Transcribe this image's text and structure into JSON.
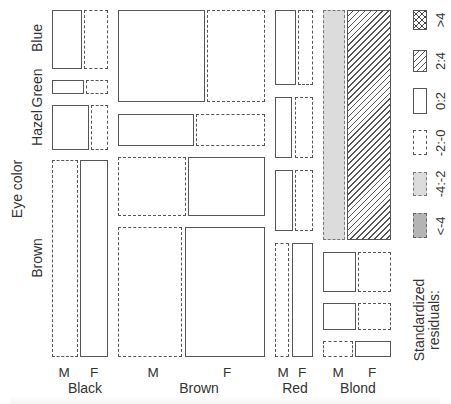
{
  "chart_data": {
    "type": "mosaic",
    "title": "",
    "xlabel": "Hair color (split by Sex)",
    "ylabel": "Eye color",
    "hair": [
      "Black",
      "Brown",
      "Red",
      "Blond"
    ],
    "eye": [
      "Blue",
      "Green",
      "Hazel",
      "Brown"
    ],
    "sex": [
      "M",
      "F"
    ],
    "legend": {
      "title": "Standardized residuals:",
      "entries": [
        ">4",
        "2:4",
        "0:2",
        "-2:-0",
        "-4:-2",
        "<-4"
      ]
    },
    "tiles": [
      {
        "hair": "Black",
        "eye": "Blue",
        "sex": "M",
        "residual": "0:2",
        "x": 52,
        "y": 10,
        "w": 30,
        "h": 59
      },
      {
        "hair": "Black",
        "eye": "Blue",
        "sex": "F",
        "residual": "-2:-0",
        "x": 84,
        "y": 10,
        "w": 24,
        "h": 59
      },
      {
        "hair": "Black",
        "eye": "Green",
        "sex": "M",
        "residual": "0:2",
        "x": 52,
        "y": 80,
        "w": 32,
        "h": 14
      },
      {
        "hair": "Black",
        "eye": "Green",
        "sex": "F",
        "residual": "-2:-0",
        "x": 86,
        "y": 80,
        "w": 22,
        "h": 14
      },
      {
        "hair": "Black",
        "eye": "Hazel",
        "sex": "M",
        "residual": "0:2",
        "x": 52,
        "y": 105,
        "w": 37,
        "h": 45
      },
      {
        "hair": "Black",
        "eye": "Hazel",
        "sex": "F",
        "residual": "-2:-0",
        "x": 91,
        "y": 105,
        "w": 17,
        "h": 45
      },
      {
        "hair": "Black",
        "eye": "Brown",
        "sex": "M",
        "residual": "-2:-0",
        "x": 52,
        "y": 160,
        "w": 26,
        "h": 197
      },
      {
        "hair": "Black",
        "eye": "Brown",
        "sex": "F",
        "residual": "0:2",
        "x": 80,
        "y": 160,
        "w": 28,
        "h": 197
      },
      {
        "hair": "Brown",
        "eye": "Blue",
        "sex": "M",
        "residual": "0:2",
        "x": 118,
        "y": 10,
        "w": 87,
        "h": 92
      },
      {
        "hair": "Brown",
        "eye": "Blue",
        "sex": "F",
        "residual": "-2:-0",
        "x": 207,
        "y": 10,
        "w": 58,
        "h": 92
      },
      {
        "hair": "Brown",
        "eye": "Green",
        "sex": "M",
        "residual": "0:2",
        "x": 118,
        "y": 114,
        "w": 76,
        "h": 32
      },
      {
        "hair": "Brown",
        "eye": "Green",
        "sex": "F",
        "residual": "-2:-0",
        "x": 196,
        "y": 114,
        "w": 69,
        "h": 32
      },
      {
        "hair": "Brown",
        "eye": "Hazel",
        "sex": "M",
        "residual": "-2:-0",
        "x": 118,
        "y": 157,
        "w": 68,
        "h": 59
      },
      {
        "hair": "Brown",
        "eye": "Hazel",
        "sex": "F",
        "residual": "0:2",
        "x": 188,
        "y": 157,
        "w": 77,
        "h": 59
      },
      {
        "hair": "Brown",
        "eye": "Brown",
        "sex": "M",
        "residual": "-2:-0",
        "x": 118,
        "y": 227,
        "w": 64,
        "h": 130
      },
      {
        "hair": "Brown",
        "eye": "Brown",
        "sex": "F",
        "residual": "0:2",
        "x": 185,
        "y": 227,
        "w": 80,
        "h": 130
      },
      {
        "hair": "Red",
        "eye": "Blue",
        "sex": "M",
        "residual": "0:2",
        "x": 275,
        "y": 10,
        "w": 21,
        "h": 75
      },
      {
        "hair": "Red",
        "eye": "Blue",
        "sex": "F",
        "residual": "-2:-0",
        "x": 298,
        "y": 10,
        "w": 15,
        "h": 75
      },
      {
        "hair": "Red",
        "eye": "Green",
        "sex": "M",
        "residual": "0:2",
        "x": 275,
        "y": 97,
        "w": 17,
        "h": 61
      },
      {
        "hair": "Red",
        "eye": "Green",
        "sex": "F",
        "residual": "-2:-0",
        "x": 295,
        "y": 97,
        "w": 18,
        "h": 61
      },
      {
        "hair": "Red",
        "eye": "Hazel",
        "sex": "M",
        "residual": "0:2",
        "x": 275,
        "y": 170,
        "w": 18,
        "h": 61
      },
      {
        "hair": "Red",
        "eye": "Hazel",
        "sex": "F",
        "residual": "-2:-0",
        "x": 295,
        "y": 170,
        "w": 18,
        "h": 61
      },
      {
        "hair": "Red",
        "eye": "Brown",
        "sex": "M",
        "residual": "-2:-0",
        "x": 275,
        "y": 243,
        "w": 14,
        "h": 114
      },
      {
        "hair": "Red",
        "eye": "Brown",
        "sex": "F",
        "residual": "0:2",
        "x": 292,
        "y": 243,
        "w": 21,
        "h": 114
      },
      {
        "hair": "Blond",
        "eye": "Blue",
        "sex": "M",
        "residual": "-4:-2",
        "x": 323,
        "y": 10,
        "w": 22,
        "h": 230
      },
      {
        "hair": "Blond",
        "eye": "Blue",
        "sex": "F",
        "residual": "2:4",
        "x": 347,
        "y": 10,
        "w": 44,
        "h": 230
      },
      {
        "hair": "Blond",
        "eye": "Green",
        "sex": "M",
        "residual": "0:2",
        "x": 323,
        "y": 252,
        "w": 33,
        "h": 40
      },
      {
        "hair": "Blond",
        "eye": "Green",
        "sex": "F",
        "residual": "-2:-0",
        "x": 358,
        "y": 252,
        "w": 33,
        "h": 40
      },
      {
        "hair": "Blond",
        "eye": "Hazel",
        "sex": "M",
        "residual": "0:2",
        "x": 323,
        "y": 303,
        "w": 33,
        "h": 27
      },
      {
        "hair": "Blond",
        "eye": "Hazel",
        "sex": "F",
        "residual": "-2:-0",
        "x": 358,
        "y": 303,
        "w": 33,
        "h": 27
      },
      {
        "hair": "Blond",
        "eye": "Brown",
        "sex": "M",
        "residual": "-2:-0",
        "x": 323,
        "y": 341,
        "w": 30,
        "h": 16
      },
      {
        "hair": "Blond",
        "eye": "Brown",
        "sex": "F",
        "residual": "0:2",
        "x": 355,
        "y": 341,
        "w": 36,
        "h": 16
      }
    ],
    "grid": false,
    "legend_position": "right"
  },
  "axis": {
    "y_title": "Eye color",
    "y_levels": [
      {
        "label": "Blue",
        "y": 38
      },
      {
        "label": "Green",
        "y": 88
      },
      {
        "label": "Hazel",
        "y": 128
      },
      {
        "label": "Brown",
        "y": 258
      }
    ],
    "x_sex_labels": [
      {
        "label": "M",
        "x": 64
      },
      {
        "label": "F",
        "x": 94
      },
      {
        "label": "M",
        "x": 153
      },
      {
        "label": "F",
        "x": 227
      },
      {
        "label": "M",
        "x": 283
      },
      {
        "label": "F",
        "x": 302
      },
      {
        "label": "M",
        "x": 338
      },
      {
        "label": "F",
        "x": 372
      }
    ],
    "x_hair_labels": [
      {
        "label": "Black",
        "x": 85
      },
      {
        "label": "Brown",
        "x": 199
      },
      {
        "label": "Red",
        "x": 295
      },
      {
        "label": "Blond",
        "x": 358
      }
    ]
  },
  "legend": {
    "title": "Standardized residuals:",
    "items": [
      {
        "label": ">4",
        "style": "cross",
        "y": 10,
        "h": 20
      },
      {
        "label": "2:4",
        "style": "hatch",
        "y": 50,
        "h": 22
      },
      {
        "label": "0:2",
        "style": "solid",
        "y": 88,
        "h": 26
      },
      {
        "label": "-2:-0",
        "style": "dashed",
        "y": 130,
        "h": 25
      },
      {
        "label": "-4:-2",
        "style": "neg2",
        "y": 172,
        "h": 24
      },
      {
        "label": "<-4",
        "style": "neg4",
        "y": 213,
        "h": 25
      }
    ]
  }
}
